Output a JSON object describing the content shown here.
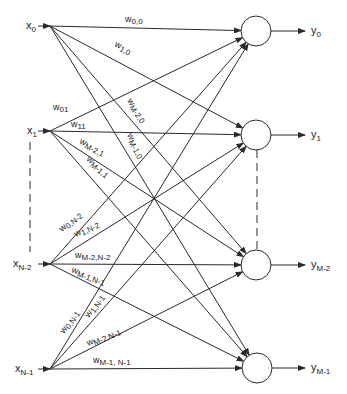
{
  "diagram": {
    "type": "fully-connected single-layer network",
    "colors": {
      "stroke": "#2a2a2a",
      "background": "#ffffff"
    },
    "inputs": [
      {
        "id": "x0",
        "base": "x",
        "sub": "0",
        "y": 26
      },
      {
        "id": "x1",
        "base": "x",
        "sub": "1",
        "y": 131
      },
      {
        "id": "xN-2",
        "base": "x",
        "sub": "N-2",
        "y": 264
      },
      {
        "id": "xN-1",
        "base": "x",
        "sub": "N-1",
        "y": 369
      }
    ],
    "outputs": [
      {
        "id": "y0",
        "base": "y",
        "sub": "0",
        "y": 31
      },
      {
        "id": "y1",
        "base": "y",
        "sub": "1",
        "y": 135
      },
      {
        "id": "yM-2",
        "base": "y",
        "sub": "M-2",
        "y": 265
      },
      {
        "id": "yM-1",
        "base": "y",
        "sub": "M-1",
        "y": 368
      }
    ],
    "weight_labels": [
      {
        "base": "w",
        "sub": "0,0",
        "from": 0,
        "to": 0
      },
      {
        "base": "w",
        "sub": "1,0",
        "from": 0,
        "to": 1
      },
      {
        "base": "w",
        "sub": "M-2,0",
        "from": 0,
        "to": 2
      },
      {
        "base": "w",
        "sub": "M-1,0",
        "from": 0,
        "to": 3
      },
      {
        "base": "w",
        "sub": "01",
        "from": 1,
        "to": 0
      },
      {
        "base": "w",
        "sub": "11",
        "from": 1,
        "to": 1
      },
      {
        "base": "w",
        "sub": "M-2,1",
        "from": 1,
        "to": 2
      },
      {
        "base": "w",
        "sub": "M-1,1",
        "from": 1,
        "to": 3
      },
      {
        "base": "w",
        "sub": "0,N-2",
        "from": 2,
        "to": 0
      },
      {
        "base": "w",
        "sub": "1,N-2",
        "from": 2,
        "to": 1
      },
      {
        "base": "w",
        "sub": "M-2,N-2",
        "from": 2,
        "to": 2
      },
      {
        "base": "w",
        "sub": "M-1,N-1",
        "from": 2,
        "to": 3
      },
      {
        "base": "w",
        "sub": "0,N-1",
        "from": 3,
        "to": 0
      },
      {
        "base": "w",
        "sub": "1,N-1",
        "from": 3,
        "to": 1
      },
      {
        "base": "w",
        "sub": "M-2,N-1",
        "from": 3,
        "to": 2
      },
      {
        "base": "w",
        "sub": "M-1, N-1",
        "from": 3,
        "to": 3
      }
    ]
  }
}
